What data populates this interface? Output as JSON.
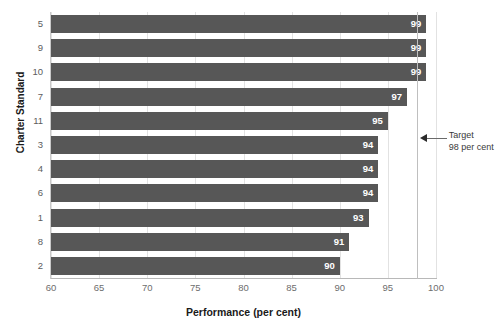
{
  "chart_data": {
    "type": "bar",
    "orientation": "horizontal",
    "title": "",
    "xlabel": "Performance (per cent)",
    "ylabel": "Charter Standard",
    "categories": [
      "5",
      "9",
      "10",
      "7",
      "11",
      "3",
      "4",
      "6",
      "1",
      "8",
      "2"
    ],
    "values": [
      99,
      99,
      99,
      97,
      95,
      94,
      94,
      94,
      93,
      91,
      90
    ],
    "data_labels": [
      "99",
      "99",
      "99",
      "97",
      "95",
      "94",
      "94",
      "94",
      "93",
      "91",
      "90"
    ],
    "xlim": [
      60,
      100
    ],
    "xticks": [
      60,
      65,
      70,
      75,
      80,
      85,
      90,
      95,
      100
    ],
    "xtick_labels": [
      "60",
      "65",
      "70",
      "75",
      "80",
      "85",
      "90",
      "95",
      "100"
    ],
    "grid": "vertical",
    "legend": "none",
    "annotations": [
      {
        "name": "target-reference-line",
        "value": 98,
        "label_line1": "Target",
        "label_line2": "98 per cent",
        "marker": "left-arrow"
      }
    ],
    "colors": {
      "bar": "#575757",
      "bar_label": "#ffffff",
      "gridline": "#e2e2e2",
      "axis": "#b8b8b8",
      "target_line": "#bfbfbf",
      "tick_text": "#6d6d6d",
      "axis_title": "#1a1a1a",
      "background": "#ffffff"
    }
  }
}
